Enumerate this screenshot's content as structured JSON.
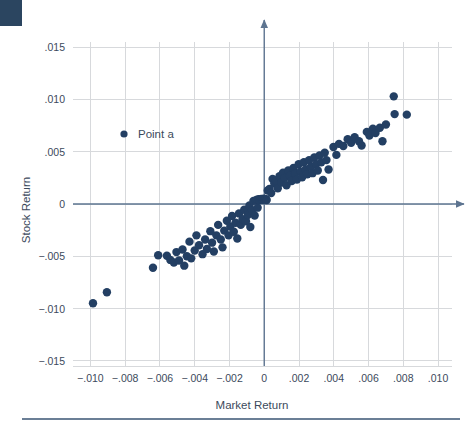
{
  "figure": {
    "background_color": "#ffffff",
    "corner_tab_color": "#2b4560",
    "rule_color": "#6b7f96"
  },
  "chart_data": {
    "type": "scatter",
    "title": "",
    "xlabel": "Market Return",
    "ylabel": "Stock Return",
    "xlim": [
      -0.011,
      0.0108
    ],
    "ylim": [
      -0.0155,
      0.0155
    ],
    "xticks": [
      -0.01,
      -0.008,
      -0.006,
      -0.004,
      -0.002,
      0,
      0.002,
      0.004,
      0.006,
      0.008,
      0.01
    ],
    "xticklabels": [
      "−.010",
      "−.008",
      "−.006",
      "−.004",
      "−.002",
      "0",
      ".002",
      ".004",
      ".006",
      ".008",
      ".010"
    ],
    "yticks": [
      0.015,
      0.01,
      0.005,
      0,
      -0.005,
      -0.01,
      -0.015
    ],
    "yticklabels": [
      ".015",
      ".010",
      ".005",
      "0",
      "−.005",
      "−.010",
      "−.015"
    ],
    "grid": true,
    "grid_color": "#d7d9dc",
    "axis_color": "#5d7490",
    "marker_color": "#233f63",
    "marker_size": 4.2,
    "legend": {
      "position": "upper-left-inside",
      "entries": [
        {
          "label": "Point a",
          "marker": "circle",
          "color": "#233f63"
        }
      ]
    },
    "series": [
      {
        "name": "Point a",
        "points": [
          [
            -0.00985,
            -0.0095
          ],
          [
            -0.00905,
            -0.00845
          ],
          [
            -0.0064,
            -0.0061
          ],
          [
            -0.0061,
            -0.0049
          ],
          [
            -0.0056,
            -0.00495
          ],
          [
            -0.0054,
            -0.00535
          ],
          [
            -0.0052,
            -0.0056
          ],
          [
            -0.00505,
            -0.0046
          ],
          [
            -0.0049,
            -0.0054
          ],
          [
            -0.0047,
            -0.00435
          ],
          [
            -0.0046,
            -0.0059
          ],
          [
            -0.00445,
            -0.005
          ],
          [
            -0.0043,
            -0.0036
          ],
          [
            -0.0042,
            -0.0052
          ],
          [
            -0.004,
            -0.00445
          ],
          [
            -0.0039,
            -0.003
          ],
          [
            -0.00375,
            -0.00395
          ],
          [
            -0.00355,
            -0.0048
          ],
          [
            -0.0034,
            -0.0034
          ],
          [
            -0.0033,
            -0.0043
          ],
          [
            -0.0031,
            -0.0026
          ],
          [
            -0.003,
            -0.0037
          ],
          [
            -0.0029,
            -0.00455
          ],
          [
            -0.00275,
            -0.003
          ],
          [
            -0.00265,
            -0.002
          ],
          [
            -0.0025,
            -0.0034
          ],
          [
            -0.0024,
            -0.00415
          ],
          [
            -0.0023,
            -0.00255
          ],
          [
            -0.00215,
            -0.0016
          ],
          [
            -0.00205,
            -0.003
          ],
          [
            -0.00195,
            -0.00215
          ],
          [
            -0.00185,
            -0.00115
          ],
          [
            -0.00175,
            -0.00265
          ],
          [
            -0.00165,
            -0.0018
          ],
          [
            -0.00155,
            -0.0033
          ],
          [
            -0.00145,
            -0.0009
          ],
          [
            -0.00135,
            -0.002
          ],
          [
            -0.00125,
            -0.00145
          ],
          [
            -0.00115,
            -0.00055
          ],
          [
            -0.00105,
            -0.00165
          ],
          [
            -0.00095,
            -0.00105
          ],
          [
            -0.00085,
            -0.00015
          ],
          [
            -0.0008,
            -0.0022
          ],
          [
            -0.0007,
            -0.0006
          ],
          [
            -0.00062,
            0.0003
          ],
          [
            -0.00055,
            -0.0011
          ],
          [
            -0.00048,
            0.00035
          ],
          [
            -0.00042,
            0.0004
          ],
          [
            -0.00038,
            -0.00035
          ],
          [
            -0.00032,
            0.00045
          ],
          [
            -0.00028,
            0.00038
          ],
          [
            -0.00022,
            0.00042
          ],
          [
            -0.00018,
            0.00048
          ],
          [
            -0.00012,
            0.0004
          ],
          [
            -8e-05,
            0.00045
          ],
          [
            -4e-05,
            0.0005
          ],
          [
            2e-05,
            0.00042
          ],
          [
            8e-05,
            0.00048
          ],
          [
            0.00014,
            0.00038
          ],
          [
            0.0002,
            0.0013
          ],
          [
            0.0003,
            0.00145
          ],
          [
            0.0004,
            0.00105
          ],
          [
            0.00048,
            0.0024
          ],
          [
            0.00058,
            0.00195
          ],
          [
            0.00068,
            0.00225
          ],
          [
            0.00078,
            0.0015
          ],
          [
            0.00088,
            0.00265
          ],
          [
            0.00098,
            0.00205
          ],
          [
            0.00108,
            0.003
          ],
          [
            0.00118,
            0.0025
          ],
          [
            0.00128,
            0.0018
          ],
          [
            0.00138,
            0.0032
          ],
          [
            0.00148,
            0.0027
          ],
          [
            0.00158,
            0.0022
          ],
          [
            0.00168,
            0.00345
          ],
          [
            0.00178,
            0.0029
          ],
          [
            0.00188,
            0.00235
          ],
          [
            0.00198,
            0.0038
          ],
          [
            0.00208,
            0.0031
          ],
          [
            0.00218,
            0.00255
          ],
          [
            0.00228,
            0.004
          ],
          [
            0.00238,
            0.0033
          ],
          [
            0.00248,
            0.00285
          ],
          [
            0.00258,
            0.0042
          ],
          [
            0.00268,
            0.00355
          ],
          [
            0.00278,
            0.00295
          ],
          [
            0.00288,
            0.00445
          ],
          [
            0.00298,
            0.0038
          ],
          [
            0.00308,
            0.0032
          ],
          [
            0.00318,
            0.00465
          ],
          [
            0.00328,
            0.004
          ],
          [
            0.00338,
            0.0023
          ],
          [
            0.00348,
            0.0049
          ],
          [
            0.00358,
            0.0042
          ],
          [
            0.00398,
            0.00545
          ],
          [
            0.0043,
            0.00575
          ],
          [
            0.00455,
            0.00555
          ],
          [
            0.0048,
            0.0062
          ],
          [
            0.005,
            0.00585
          ],
          [
            0.0052,
            0.0064
          ],
          [
            0.00545,
            0.006
          ],
          [
            0.0056,
            0.0056
          ],
          [
            0.0059,
            0.0069
          ],
          [
            0.00605,
            0.00655
          ],
          [
            0.00625,
            0.0072
          ],
          [
            0.0064,
            0.0068
          ],
          [
            0.00665,
            0.0073
          ],
          [
            0.0068,
            0.006
          ],
          [
            0.007,
            0.0076
          ],
          [
            0.00745,
            0.0103
          ],
          [
            0.0075,
            0.0086
          ],
          [
            0.0082,
            0.00855
          ],
          [
            0.00415,
            0.0047
          ],
          [
            0.0037,
            0.0033
          ]
        ]
      }
    ]
  }
}
